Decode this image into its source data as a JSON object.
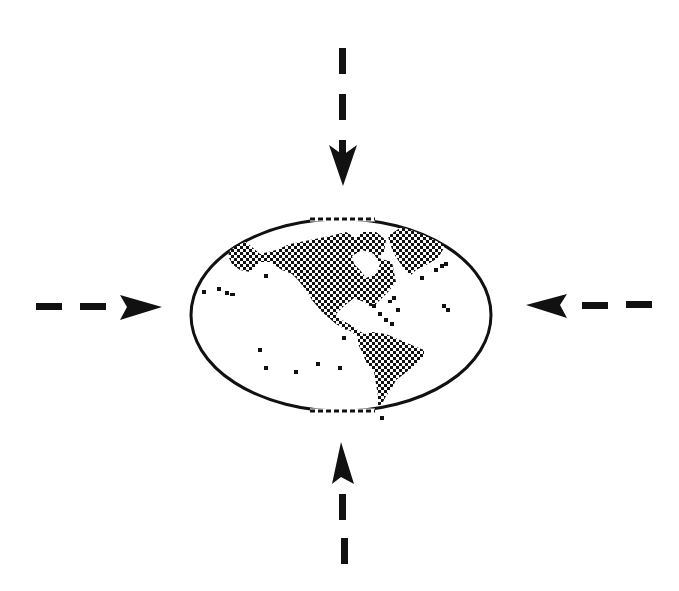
{
  "diagram": {
    "colors": {
      "background": "#ffffff",
      "ink": "#111111"
    },
    "globe": {
      "label": "",
      "visible_regions": [
        "North America",
        "Greenland",
        "South America",
        "Pacific islands"
      ],
      "pole_edges": "dashed"
    },
    "arrows": [
      {
        "id": "top",
        "direction": "down",
        "style": "dashed"
      },
      {
        "id": "bottom",
        "direction": "up",
        "style": "dashed"
      },
      {
        "id": "left",
        "direction": "right",
        "style": "dashed"
      },
      {
        "id": "right",
        "direction": "left",
        "style": "dashed"
      }
    ]
  }
}
